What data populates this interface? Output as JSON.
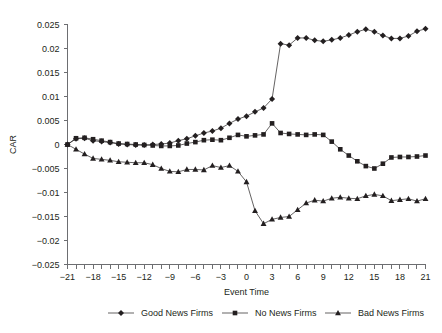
{
  "chart_data": {
    "type": "line",
    "title": "",
    "xlabel": "Event Time",
    "ylabel": "CAR",
    "xlim": [
      -21,
      21
    ],
    "ylim": [
      -0.025,
      0.025
    ],
    "grid": false,
    "legend_position": "bottom",
    "x_tick_step": 1,
    "x_label_step": 3,
    "y_tick_step": 0.005,
    "x_tick_labels": [
      "-21",
      "-18",
      "-15",
      "-12",
      "-9",
      "-6",
      "-3",
      "0",
      "3",
      "6",
      "9",
      "12",
      "15",
      "18",
      "21"
    ],
    "y_tick_labels": [
      "0.025",
      "0.02",
      "0.015",
      "0.01",
      "0.005",
      "0",
      "-0.005",
      "-0.01",
      "-0.015",
      "-0.02",
      "-0.025"
    ],
    "x": [
      -21,
      -20,
      -19,
      -18,
      -17,
      -16,
      -15,
      -14,
      -13,
      -12,
      -11,
      -10,
      -9,
      -8,
      -7,
      -6,
      -5,
      -4,
      -3,
      -2,
      -1,
      0,
      1,
      2,
      3,
      4,
      5,
      6,
      7,
      8,
      9,
      10,
      11,
      12,
      13,
      14,
      15,
      16,
      17,
      18,
      19,
      20,
      21
    ],
    "series": [
      {
        "name": "Good News Firms",
        "marker": "diamond",
        "values": [
          0.0,
          0.0012,
          0.0013,
          0.0008,
          0.0006,
          0.0004,
          0.0001,
          0.0,
          -0.0001,
          -0.0001,
          0.0,
          0.0001,
          0.0003,
          0.0008,
          0.0012,
          0.0018,
          0.0024,
          0.0028,
          0.0034,
          0.0044,
          0.0053,
          0.0059,
          0.0068,
          0.0076,
          0.0095,
          0.021,
          0.0207,
          0.0222,
          0.0222,
          0.0217,
          0.0215,
          0.0218,
          0.0222,
          0.0228,
          0.0235,
          0.024,
          0.0235,
          0.0227,
          0.0221,
          0.0221,
          0.0226,
          0.0236,
          0.0241
        ]
      },
      {
        "name": "No News Firms",
        "marker": "square",
        "values": [
          0.0,
          0.0013,
          0.0014,
          0.0011,
          0.0008,
          0.0005,
          0.0002,
          0.0001,
          0.0,
          -0.0001,
          -0.0002,
          -0.0003,
          -0.0003,
          -0.0002,
          0.0002,
          0.0005,
          0.0009,
          0.001,
          0.0009,
          0.0014,
          0.002,
          0.0017,
          0.0019,
          0.0021,
          0.0044,
          0.0024,
          0.0022,
          0.0021,
          0.002,
          0.0021,
          0.002,
          0.0006,
          -0.001,
          -0.0023,
          -0.0035,
          -0.0045,
          -0.005,
          -0.004,
          -0.0027,
          -0.0026,
          -0.0026,
          -0.0025,
          -0.0023
        ]
      },
      {
        "name": "Bad News Firms",
        "marker": "triangle",
        "values": [
          0.0,
          -0.001,
          -0.002,
          -0.0029,
          -0.0031,
          -0.0033,
          -0.0036,
          -0.0037,
          -0.0038,
          -0.0038,
          -0.0042,
          -0.005,
          -0.0056,
          -0.0057,
          -0.0052,
          -0.0052,
          -0.0053,
          -0.0044,
          -0.0048,
          -0.0044,
          -0.0056,
          -0.0078,
          -0.0138,
          -0.0165,
          -0.0156,
          -0.0152,
          -0.015,
          -0.0136,
          -0.0122,
          -0.0116,
          -0.0118,
          -0.0112,
          -0.011,
          -0.0112,
          -0.0113,
          -0.0107,
          -0.0104,
          -0.0107,
          -0.0117,
          -0.0115,
          -0.0113,
          -0.0118,
          -0.0113
        ]
      }
    ]
  },
  "legend": {
    "items": [
      {
        "label": "Good News Firms",
        "marker": "diamond-marker"
      },
      {
        "label": "No News Firms",
        "marker": "square-marker"
      },
      {
        "label": "Bad News Firms",
        "marker": "triangle-marker"
      }
    ]
  },
  "axes": {
    "y_title": "CAR",
    "x_title": "Event Time"
  },
  "colors": {
    "line": "#231f20",
    "axis": "#6d6e71",
    "background": "#ffffff"
  }
}
